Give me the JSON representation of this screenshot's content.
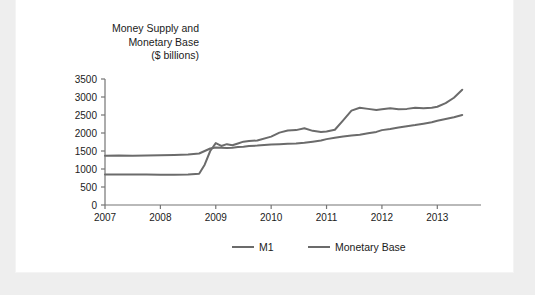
{
  "figure": {
    "title": "Money Supply and\nMonetary Base\n($ billions)"
  },
  "colors": {
    "m1_line": "#6b6b6b",
    "monetary_base_line": "#6b6b6b",
    "axis": "#757575",
    "text": "#1b1b1b",
    "card_background": "#ffffff",
    "page_background": "#eeeeee"
  },
  "chart_data": {
    "type": "line",
    "title": "Money Supply and Monetary Base ($ billions)",
    "xlabel": "",
    "ylabel": "$ billions",
    "grid": false,
    "legend_position": "bottom",
    "xlim": [
      2007.0,
      2013.5
    ],
    "ylim": [
      0,
      3500
    ],
    "ytick_labels": [
      "0",
      "500",
      "1000",
      "1500",
      "2000",
      "2500",
      "3000",
      "3500"
    ],
    "yticks": [
      0,
      500,
      1000,
      1500,
      2000,
      2500,
      3000,
      3500
    ],
    "xtick_labels": [
      "2007",
      "2008",
      "2009",
      "2010",
      "2011",
      "2012",
      "2013"
    ],
    "xticks": [
      2007,
      2008,
      2009,
      2010,
      2011,
      2012,
      2013
    ],
    "x": [
      2007.0,
      2007.25,
      2007.5,
      2007.75,
      2008.0,
      2008.25,
      2008.5,
      2008.7,
      2008.8,
      2008.9,
      2009.0,
      2009.1,
      2009.2,
      2009.3,
      2009.4,
      2009.5,
      2009.6,
      2009.75,
      2010.0,
      2010.15,
      2010.3,
      2010.45,
      2010.6,
      2010.75,
      2010.9,
      2011.0,
      2011.15,
      2011.3,
      2011.45,
      2011.6,
      2011.75,
      2011.9,
      2012.0,
      2012.15,
      2012.3,
      2012.45,
      2012.6,
      2012.75,
      2012.9,
      2013.0,
      2013.15,
      2013.3,
      2013.45
    ],
    "series": [
      {
        "name": "M1",
        "values": [
          1370,
          1375,
          1370,
          1375,
          1380,
          1390,
          1400,
          1430,
          1500,
          1570,
          1600,
          1590,
          1580,
          1590,
          1610,
          1620,
          1640,
          1650,
          1680,
          1690,
          1700,
          1710,
          1730,
          1760,
          1790,
          1830,
          1870,
          1900,
          1930,
          1950,
          1990,
          2030,
          2080,
          2110,
          2150,
          2190,
          2220,
          2260,
          2300,
          2340,
          2390,
          2440,
          2500
        ]
      },
      {
        "name": "Monetary Base",
        "values": [
          850,
          850,
          845,
          845,
          840,
          840,
          845,
          870,
          1120,
          1500,
          1720,
          1640,
          1690,
          1660,
          1710,
          1760,
          1780,
          1790,
          1900,
          2010,
          2070,
          2080,
          2130,
          2060,
          2030,
          2040,
          2090,
          2350,
          2620,
          2700,
          2670,
          2640,
          2660,
          2690,
          2660,
          2670,
          2700,
          2690,
          2700,
          2730,
          2830,
          2980,
          3200
        ]
      }
    ]
  },
  "legend": {
    "items": [
      {
        "label": "M1"
      },
      {
        "label": "Monetary Base"
      }
    ]
  }
}
